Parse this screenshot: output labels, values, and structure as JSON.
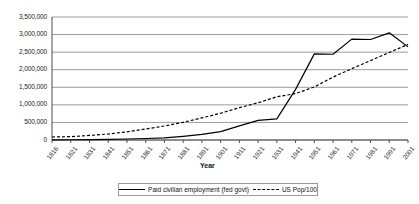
{
  "chart_data": {
    "type": "line",
    "title": "",
    "xlabel": "Year",
    "ylabel": "",
    "grid": true,
    "legend_position": "bottom",
    "categories": [
      "1816",
      "1821",
      "1831",
      "1841",
      "1851",
      "1861",
      "1871",
      "1881",
      "1891",
      "1901",
      "1911",
      "1921",
      "1931",
      "1941",
      "1951",
      "1961",
      "1971",
      "1981",
      "1991",
      "2001"
    ],
    "ylim": [
      0,
      3500000
    ],
    "ytick_labels": [
      "3,500,000",
      "3,000,000",
      "2,500,000",
      "2,000,000",
      "1,500,000",
      "1,000,000",
      "500,000",
      "0"
    ],
    "ytick_values": [
      3500000,
      3000000,
      2500000,
      2000000,
      1500000,
      1000000,
      500000,
      0
    ],
    "series": [
      {
        "name": "Paid civilian employment (fed govt)",
        "style": "solid",
        "color": "#000000",
        "values": [
          5000,
          7000,
          12000,
          19000,
          28000,
          42000,
          60000,
          105000,
          160000,
          240000,
          400000,
          560000,
          600000,
          1440000,
          2450000,
          2440000,
          2870000,
          2860000,
          3050000,
          2650000
        ]
      },
      {
        "name": "US Pop/100",
        "style": "dashed",
        "color": "#000000",
        "values": [
          85000,
          96000,
          129000,
          171000,
          232000,
          314000,
          398000,
          503000,
          630000,
          762000,
          920000,
          1060000,
          1230000,
          1320000,
          1510000,
          1790000,
          2030000,
          2260000,
          2490000,
          2720000
        ]
      }
    ],
    "legend": [
      {
        "label": "Paid civilian employment (fed govt)",
        "style": "solid"
      },
      {
        "label": "US Pop/100",
        "style": "dashed"
      }
    ]
  }
}
